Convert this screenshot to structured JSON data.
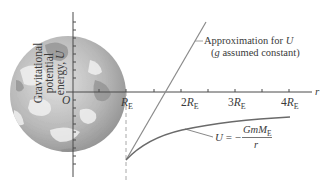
{
  "figure": {
    "y_axis_label_line1": "Gravitational",
    "y_axis_label_line2": "potential",
    "y_axis_label_line3_prefix": "energy, ",
    "y_axis_label_symbol": "U",
    "origin_label": "O",
    "x_axis_symbol": "r",
    "x_ticks": [
      {
        "coef": "",
        "sym": "R",
        "sub": "E"
      },
      {
        "coef": "2",
        "sym": "R",
        "sub": "E"
      },
      {
        "coef": "3",
        "sym": "R",
        "sub": "E"
      },
      {
        "coef": "4",
        "sym": "R",
        "sub": "E"
      }
    ],
    "approx_label_line1_prefix": "Approximation for ",
    "approx_label_line1_symbol": "U",
    "approx_label_line2_open": "(",
    "approx_label_line2_symbol": "g",
    "approx_label_line2_rest": " assumed constant)",
    "formula_lhs": "U",
    "formula_eq": " = −",
    "formula_numerator": "GmM",
    "formula_numerator_sub": "E",
    "formula_denominator": "r"
  },
  "colors": {
    "axis": "#4a4a4a",
    "curve": "#6a6a6a",
    "approx_line": "#8a8a8a",
    "dashed": "#a8a8a8",
    "earth_light": "#d4d4d4",
    "earth_dark": "#9a9a9a"
  }
}
